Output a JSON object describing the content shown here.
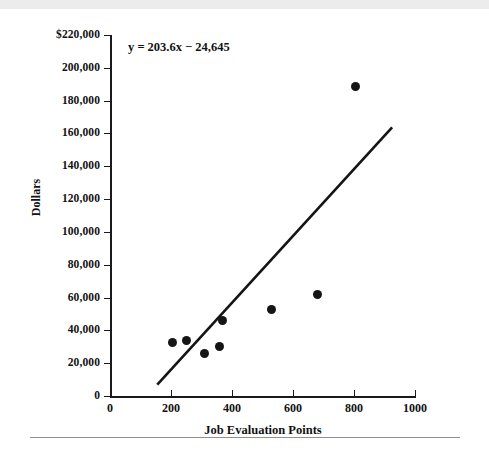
{
  "figure": {
    "name": "scatter-plot-with-regression-line",
    "annotation": "y = 203.6x − 24,645"
  },
  "chart_data": {
    "type": "scatter",
    "title": "",
    "xlabel": "Job Evaluation Points",
    "ylabel": "Dollars",
    "xlim": [
      0,
      1000
    ],
    "ylim": [
      0,
      220000
    ],
    "grid": false,
    "legend": null,
    "x_ticks": [
      0,
      200,
      400,
      600,
      800,
      1000
    ],
    "x_tick_labels": [
      "0",
      "200",
      "400",
      "600",
      "800",
      "1000"
    ],
    "y_ticks": [
      0,
      20000,
      40000,
      60000,
      80000,
      100000,
      120000,
      140000,
      160000,
      180000,
      200000,
      220000
    ],
    "y_tick_labels": [
      "0",
      "20,000",
      "40,000",
      "60,000",
      "80,000",
      "100,000",
      "120,000",
      "140,000",
      "160,000",
      "180,000",
      "200,000",
      "$220,000"
    ],
    "points": [
      {
        "x": 205,
        "y": 32500
      },
      {
        "x": 250,
        "y": 34000
      },
      {
        "x": 310,
        "y": 26000
      },
      {
        "x": 360,
        "y": 30000
      },
      {
        "x": 370,
        "y": 46000
      },
      {
        "x": 530,
        "y": 53000
      },
      {
        "x": 680,
        "y": 62000
      },
      {
        "x": 805,
        "y": 188500
      }
    ],
    "trendline": {
      "equation": "y = 203.6x − 24,645",
      "slope": 203.6,
      "intercept": -24645,
      "x_start": 155,
      "x_end": 925
    },
    "annotations": [
      {
        "text": "y = 203.6x − 24,645",
        "x": 60,
        "y": 212000
      }
    ]
  }
}
